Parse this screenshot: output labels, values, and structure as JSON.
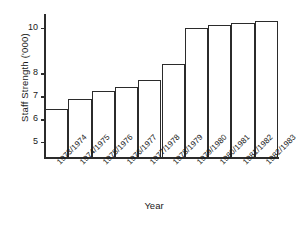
{
  "chart_data": {
    "type": "bar",
    "title": "",
    "xlabel": "Year",
    "ylabel": "Staff Strength ('000)",
    "categories": [
      "1973/1974",
      "1974/1975",
      "1975/1976",
      "1976/1977",
      "1977/1978",
      "1978/1979",
      "1979/1980",
      "1980/1981",
      "1981/1982",
      "1982/1983"
    ],
    "values": [
      6.45,
      6.9,
      7.25,
      7.4,
      7.7,
      8.4,
      10.0,
      10.1,
      10.2,
      10.3
    ],
    "ytick_labels": [
      "10",
      "8",
      "7",
      "6",
      "5"
    ],
    "ytick_values": [
      10,
      8,
      7,
      6,
      5
    ],
    "ylim": [
      4.3,
      10.6
    ],
    "grid": false,
    "legend": null,
    "bar_fill": "#ffffff",
    "bar_edge": "#2b2b2b",
    "axis_color": "#2b2b2b"
  },
  "figure": {
    "background": "#ffffff",
    "caption_fragment": ""
  }
}
